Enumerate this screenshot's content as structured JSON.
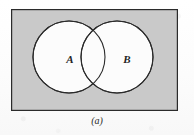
{
  "figure": {
    "kind": "venn-diagram",
    "caption": "(a)",
    "universe": {
      "name": "universal-set-rectangle",
      "fill_color": "#c9c9c9",
      "stroke_color": "#2b2b2b",
      "x": 11,
      "y": 9,
      "width": 167,
      "height": 102
    },
    "sets": [
      {
        "label": "A",
        "name": "set-a",
        "fill_color": "#fcfcfc",
        "stroke_color": "#2b2b2b",
        "cx": 69,
        "cy": 57,
        "r": 36
      },
      {
        "label": "B",
        "name": "set-b",
        "fill_color": "#fcfcfc",
        "stroke_color": "#2b2b2b",
        "cx": 117,
        "cy": 57,
        "r": 36
      }
    ],
    "background_color": "#fdfdfd"
  }
}
